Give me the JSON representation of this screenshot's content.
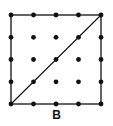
{
  "figure": {
    "label": "B",
    "grid": {
      "rows": 5,
      "cols": 5,
      "x": [
        11,
        33.5,
        56,
        78.5,
        101
      ],
      "y": [
        15,
        37.3,
        59.5,
        81.8,
        104
      ]
    },
    "square": {
      "from": [
        0,
        0
      ],
      "to": [
        4,
        4
      ]
    },
    "diagonal": {
      "from": "bottom-left",
      "to": "top-right"
    },
    "colors": {
      "line": "#111111",
      "dot": "#111111",
      "background": "#ffffff"
    }
  }
}
